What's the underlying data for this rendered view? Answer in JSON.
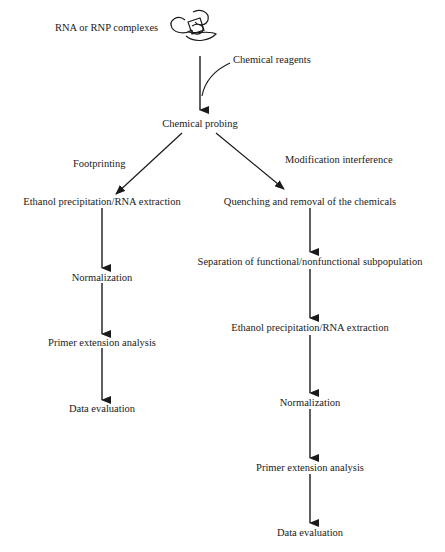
{
  "diagram": {
    "start": {
      "label": "RNA or RNP complexes",
      "icon": "rna-tangle-icon"
    },
    "reagent": {
      "label": "Chemical reagents"
    },
    "probing": {
      "label": "Chemical probing"
    },
    "branches": {
      "left": {
        "label": "Footprinting",
        "steps": [
          "Ethanol precipitation/RNA extraction",
          "Normalization",
          "Primer extension analysis",
          "Data evaluation"
        ]
      },
      "right": {
        "label": "Modification interference",
        "steps": [
          "Quenching and removal of the chemicals",
          "Separation of functional/nonfunctional subpopulation",
          "Ethanol precipitation/RNA extraction",
          "Normalization",
          "Primer extension analysis",
          "Data evaluation"
        ]
      }
    },
    "colors": {
      "line": "#1a1a1a",
      "text": "#1a1a1a",
      "background": "#ffffff"
    }
  }
}
